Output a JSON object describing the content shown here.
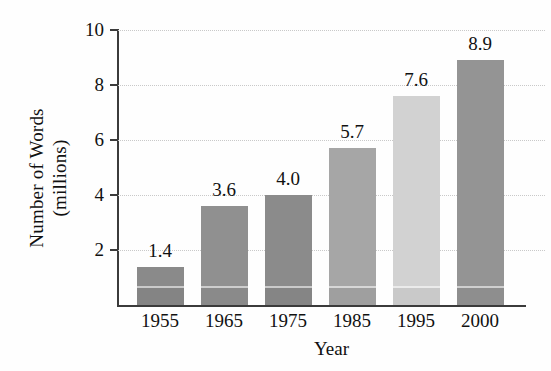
{
  "chart_data": {
    "type": "bar",
    "title": "",
    "categories": [
      "1955",
      "1965",
      "1975",
      "1985",
      "1995",
      "2000"
    ],
    "values": [
      1.4,
      3.6,
      4.0,
      5.7,
      7.6,
      8.9
    ],
    "value_labels": [
      "1.4",
      "3.6",
      "4.0",
      "5.7",
      "7.6",
      "8.9"
    ],
    "xlabel": "Year",
    "ylabel_line1": "Number of Words",
    "ylabel_line2": "(millions)",
    "ylim": [
      0,
      10
    ],
    "yticks": [
      2,
      4,
      6,
      8,
      10
    ],
    "ytick_labels": [
      "2",
      "4",
      "6",
      "8",
      "10"
    ],
    "grid": true,
    "grid_style": "dotted",
    "legend": "none",
    "bar_colors": [
      "#8a8a8a",
      "#909090",
      "#8b8b8b",
      "#a6a6a6",
      "#d2d2d2",
      "#949494"
    ]
  },
  "axis": {
    "line_color": "#3b3b3b",
    "grid_color": "#c9c9c9"
  }
}
